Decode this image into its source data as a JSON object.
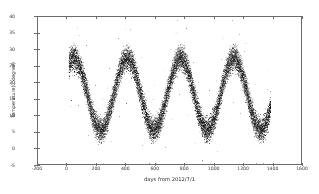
{
  "figure": {
    "background_color": "#ffffff",
    "frame_color": "#6b6b6b",
    "marker_color": "#000000"
  },
  "axis": {
    "xlabel": "days from 2012/7/1",
    "ylabel": "Temperature(C degree)",
    "x_ticklabels": [
      "-200",
      "0",
      "200",
      "400",
      "600",
      "800",
      "1000",
      "1200",
      "1400",
      "1600"
    ],
    "y_ticklabels": [
      "-5",
      "0",
      "5",
      "10",
      "15",
      "20",
      "25",
      "30",
      "35",
      "40"
    ]
  },
  "chart_data": {
    "type": "scatter",
    "title": "",
    "xlabel": "days from 2012/7/1",
    "ylabel": "Temperature(C degree)",
    "xlim": [
      -200,
      1600
    ],
    "ylim": [
      -5,
      40
    ],
    "xticks": [
      -200,
      0,
      200,
      400,
      600,
      800,
      1000,
      1200,
      1400,
      1600
    ],
    "yticks": [
      -5,
      0,
      5,
      10,
      15,
      20,
      25,
      30,
      35,
      40
    ],
    "grid": false,
    "legend": null,
    "marker": "point",
    "marker_color": "#000000",
    "data_x_range": [
      10,
      1390
    ],
    "n_points_approx": 16000,
    "seasonal_model": {
      "period_days": 365,
      "mean_temp": 16.5,
      "amplitude": 11.0,
      "phase_peak_day": 45,
      "daily_spread": 7.0
    },
    "annual_cycles": [
      {
        "cycle": 1,
        "peak_day": 45,
        "peak_temp": 34.0,
        "trough_day": 215,
        "trough_temp": -1.0
      },
      {
        "cycle": 2,
        "peak_day": 410,
        "peak_temp": 37.0,
        "trough_day": 590,
        "trough_temp": -1.5
      },
      {
        "cycle": 3,
        "peak_day": 770,
        "peak_temp": 35.5,
        "trough_day": 945,
        "trough_temp": 0.5
      },
      {
        "cycle": 4,
        "peak_day": 1130,
        "peak_temp": 36.0,
        "trough_day": 1320,
        "trough_temp": -2.0
      }
    ],
    "series": [
      {
        "name": "Temperature",
        "x": [
          10,
          45,
          80,
          130,
          180,
          215,
          260,
          310,
          360,
          410,
          460,
          500,
          545,
          590,
          640,
          690,
          730,
          770,
          820,
          860,
          900,
          945,
          990,
          1040,
          1090,
          1130,
          1180,
          1230,
          1275,
          1320,
          1360,
          1390
        ],
        "y": [
          24.0,
          29.5,
          27.5,
          19.0,
          11.0,
          5.5,
          9.0,
          16.0,
          24.0,
          30.5,
          26.0,
          21.5,
          14.0,
          5.0,
          10.0,
          18.0,
          24.5,
          29.0,
          24.0,
          19.0,
          12.5,
          6.0,
          10.5,
          18.5,
          25.5,
          29.5,
          24.5,
          19.0,
          13.0,
          6.5,
          12.0,
          16.0
        ]
      }
    ]
  }
}
